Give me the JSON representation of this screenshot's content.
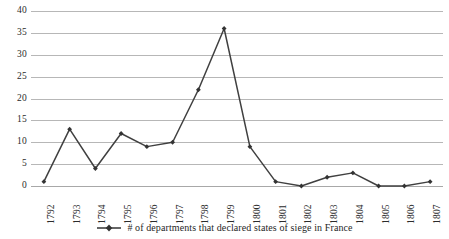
{
  "chart_data": {
    "type": "line",
    "title": "",
    "subtitle": "",
    "xlabel": "",
    "ylabel": "",
    "categories": [
      "1792",
      "1793",
      "1794",
      "1795",
      "1796",
      "1797",
      "1798",
      "1799",
      "1800",
      "1801",
      "1802",
      "1803",
      "1804",
      "1805",
      "1806",
      "1807"
    ],
    "values": [
      1,
      13,
      4,
      12,
      9,
      10,
      22,
      36,
      9,
      1,
      0,
      2,
      3,
      0,
      0,
      1
    ],
    "series": [
      {
        "name": "# of departments that declared states of siege in France",
        "values": [
          1,
          13,
          4,
          12,
          9,
          10,
          22,
          36,
          9,
          1,
          0,
          2,
          3,
          0,
          0,
          1
        ]
      }
    ],
    "ylim": [
      0,
      40
    ],
    "yticks": [
      0,
      5,
      10,
      15,
      20,
      25,
      30,
      35,
      40
    ],
    "ytick_labels": [
      "0",
      "5",
      "10",
      "15",
      "20",
      "25",
      "30",
      "35",
      "40"
    ],
    "grid": true,
    "grid_axis": "y",
    "legend_position": "bottom",
    "xtick_rotation": -90,
    "colors": {
      "series_line": "#404040",
      "marker": "#333333",
      "gridline": "#b7b7b7",
      "text": "#2b2b2b",
      "background": "#ffffff"
    }
  },
  "legend": {
    "marker_icon": "line-with-diamond-marker-icon",
    "label": "# of departments that declared states of siege in France"
  }
}
